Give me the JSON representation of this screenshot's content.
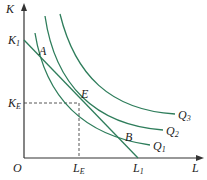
{
  "diagram": {
    "axes": {
      "x_label": "L",
      "y_label": "K",
      "origin": "O"
    },
    "points": [
      {
        "name": "A",
        "label": "A"
      },
      {
        "name": "E",
        "label": "E"
      },
      {
        "name": "B",
        "label": "B"
      }
    ],
    "axis_ticks": {
      "k1": {
        "main": "K",
        "sub": "1"
      },
      "ke": {
        "main": "K",
        "sub": "E"
      },
      "le": {
        "main": "L",
        "sub": "E"
      },
      "l1": {
        "main": "L",
        "sub": "1"
      }
    },
    "curves": [
      {
        "main": "Q",
        "sub": "1"
      },
      {
        "main": "Q",
        "sub": "2"
      },
      {
        "main": "Q",
        "sub": "3"
      }
    ],
    "colors": {
      "curve": "#2e7d5b",
      "axis": "#333333",
      "dash": "#444444"
    }
  }
}
